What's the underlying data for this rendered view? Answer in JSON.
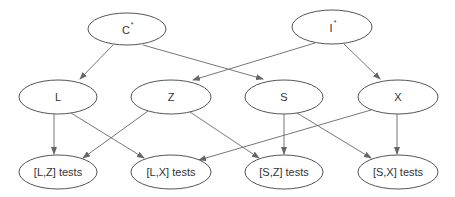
{
  "diagram": {
    "type": "directed-graph",
    "nodes": [
      {
        "id": "C",
        "label": "C",
        "superscript": "*",
        "cx": 127,
        "cy": 29,
        "rx": 39,
        "ry": 16
      },
      {
        "id": "I",
        "label": "I",
        "superscript": "*",
        "cx": 332,
        "cy": 27,
        "rx": 40,
        "ry": 17
      },
      {
        "id": "L",
        "label": "L",
        "cx": 58,
        "cy": 97,
        "rx": 39,
        "ry": 17
      },
      {
        "id": "Z",
        "label": "Z",
        "cx": 171,
        "cy": 97,
        "rx": 40,
        "ry": 17
      },
      {
        "id": "S",
        "label": "S",
        "cx": 284,
        "cy": 97,
        "rx": 39,
        "ry": 17
      },
      {
        "id": "X",
        "label": "X",
        "cx": 398,
        "cy": 97,
        "rx": 40,
        "ry": 17
      },
      {
        "id": "LZ",
        "label": "[L,Z] tests",
        "cx": 58,
        "cy": 172,
        "rx": 39,
        "ry": 17
      },
      {
        "id": "LX",
        "label": "[L,X] tests",
        "cx": 171,
        "cy": 172,
        "rx": 40,
        "ry": 17
      },
      {
        "id": "SZ",
        "label": "[S,Z] tests",
        "cx": 284,
        "cy": 172,
        "rx": 39,
        "ry": 17
      },
      {
        "id": "SX",
        "label": "[S,X] tests",
        "cx": 398,
        "cy": 172,
        "rx": 40,
        "ry": 17
      }
    ],
    "edges": [
      {
        "from": "C",
        "to": "L",
        "x1": 113,
        "y1": 45,
        "x2": 80,
        "y2": 79
      },
      {
        "from": "C",
        "to": "S",
        "x1": 143,
        "y1": 45,
        "x2": 263,
        "y2": 79
      },
      {
        "from": "I",
        "to": "Z",
        "x1": 315,
        "y1": 43,
        "x2": 193,
        "y2": 80
      },
      {
        "from": "I",
        "to": "X",
        "x1": 344,
        "y1": 44,
        "x2": 380,
        "y2": 79
      },
      {
        "from": "L",
        "to": "LZ",
        "x1": 54,
        "y1": 114,
        "x2": 54,
        "y2": 154
      },
      {
        "from": "L",
        "to": "LX",
        "x1": 71,
        "y1": 113,
        "x2": 144,
        "y2": 158
      },
      {
        "from": "Z",
        "to": "LZ",
        "x1": 148,
        "y1": 111,
        "x2": 83,
        "y2": 158
      },
      {
        "from": "Z",
        "to": "SZ",
        "x1": 190,
        "y1": 112,
        "x2": 259,
        "y2": 158
      },
      {
        "from": "S",
        "to": "SZ",
        "x1": 284,
        "y1": 114,
        "x2": 284,
        "y2": 154
      },
      {
        "from": "S",
        "to": "SX",
        "x1": 297,
        "y1": 113,
        "x2": 371,
        "y2": 158
      },
      {
        "from": "X",
        "to": "LX",
        "x1": 371,
        "y1": 110,
        "x2": 199,
        "y2": 160
      },
      {
        "from": "X",
        "to": "SX",
        "x1": 397,
        "y1": 114,
        "x2": 397,
        "y2": 154
      }
    ]
  },
  "labels": {
    "C": "C",
    "C_sup": "*",
    "I": "I",
    "I_sup": "*",
    "L": "L",
    "Z": "Z",
    "S": "S",
    "X": "X",
    "LZ": "[L,Z] tests",
    "LX": "[L,X] tests",
    "SZ": "[S,Z] tests",
    "SX": "[S,X] tests"
  },
  "colors": {
    "stroke": "#555555",
    "edge": "#666666",
    "text": "#333333",
    "background": "#ffffff"
  }
}
